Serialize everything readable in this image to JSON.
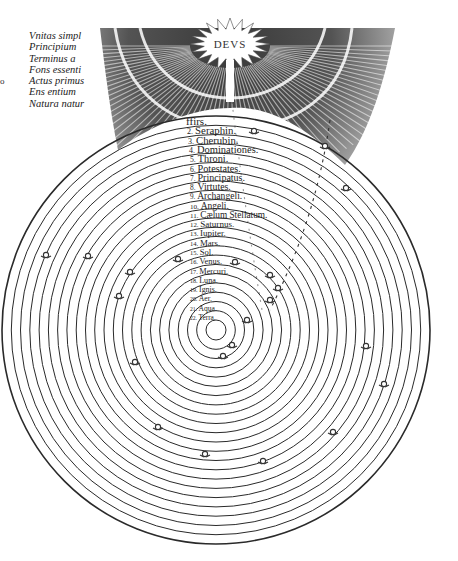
{
  "figure": {
    "center_label": "DEVS",
    "side_text": [
      "Vnitas simpl",
      "Principium",
      "Terminus a",
      "Fons essenti",
      "Actus primus",
      "Ens entium",
      "Natura natur"
    ],
    "left_mark": "o",
    "spheres": [
      {
        "n": "",
        "label": "ffirs."
      },
      {
        "n": "2.",
        "label": "Seraphin."
      },
      {
        "n": "3.",
        "label": "Cherubin."
      },
      {
        "n": "4.",
        "label": "Dominationes."
      },
      {
        "n": "5.",
        "label": "Throni."
      },
      {
        "n": "6.",
        "label": "Potestates."
      },
      {
        "n": "7.",
        "label": "Principatus."
      },
      {
        "n": "8.",
        "label": "Virtutes."
      },
      {
        "n": "9.",
        "label": "Archangeli."
      },
      {
        "n": "10.",
        "label": "Angeli."
      },
      {
        "n": "11.",
        "label": "Cælum Stellatum."
      },
      {
        "n": "12.",
        "label": "Saturnus."
      },
      {
        "n": "13.",
        "label": "Iupiter."
      },
      {
        "n": "14.",
        "label": "Mars."
      },
      {
        "n": "15.",
        "label": "Sol."
      },
      {
        "n": "16.",
        "label": "Venus."
      },
      {
        "n": "17.",
        "label": "Mercuri."
      },
      {
        "n": "18.",
        "label": "Luna."
      },
      {
        "n": "19.",
        "label": "Ignis."
      },
      {
        "n": "20.",
        "label": "Aer."
      },
      {
        "n": "21.",
        "label": "Aqua."
      },
      {
        "n": "22.",
        "label": "Terra."
      }
    ],
    "colors": {
      "ink": "#2a2a2a",
      "paper": "#ffffff",
      "hatch": "#3a3a3a"
    }
  }
}
